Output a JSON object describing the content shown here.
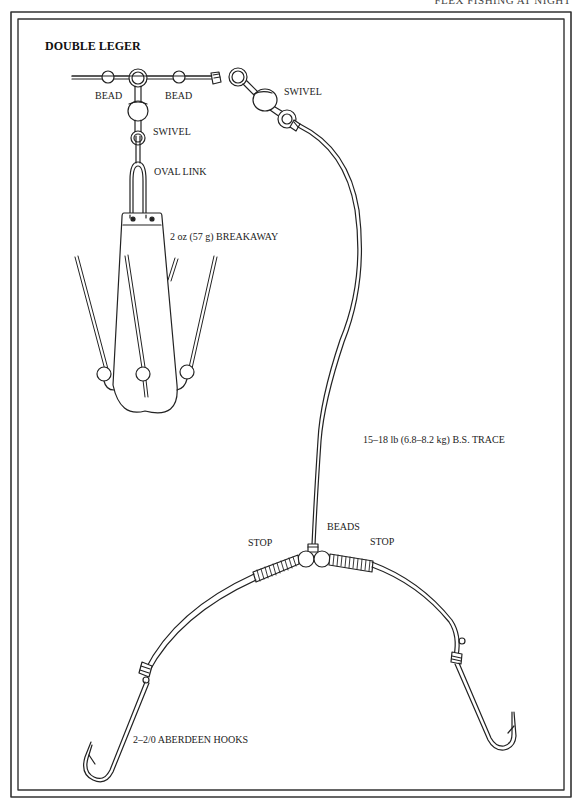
{
  "running_head": "FLEX FISHING AT NIGHT",
  "diagram": {
    "title": "DOUBLE LEGER",
    "labels": {
      "bead_left": "BEAD",
      "bead_right": "BEAD",
      "swivel_upper": "SWIVEL",
      "swivel_lower": "SWIVEL",
      "oval_link": "OVAL LINK",
      "weight": "2 oz (57 g) BREAKAWAY",
      "trace": "15–18 lb (6.8–8.2 kg) B.S. TRACE",
      "beads": "BEADS",
      "stop_left": "STOP",
      "stop_right": "STOP",
      "hooks": "2–2/0 ABERDEEN HOOKS"
    },
    "colors": {
      "ink": "#222222",
      "paper": "#ffffff",
      "frame": "#333333"
    }
  }
}
